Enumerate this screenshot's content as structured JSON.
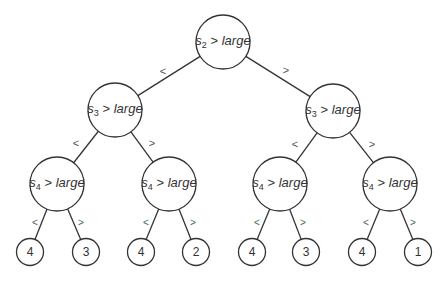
{
  "diagram": {
    "type": "binary decision tree",
    "colors": {
      "line": "#333333",
      "edge_label": "#555555",
      "background": "#ffffff"
    },
    "nodes": [
      {
        "id": "root",
        "var": "s",
        "sub": "2",
        "op": ">",
        "value": "large",
        "cx": 223,
        "cy": 42,
        "r": 27
      },
      {
        "id": "L",
        "var": "s",
        "sub": "3",
        "op": ">",
        "value": "large",
        "cx": 115,
        "cy": 110,
        "r": 27
      },
      {
        "id": "R",
        "var": "s",
        "sub": "3",
        "op": ">",
        "value": "large",
        "cx": 333,
        "cy": 111,
        "r": 27
      },
      {
        "id": "LL",
        "var": "s",
        "sub": "4",
        "op": ">",
        "value": "large",
        "cx": 57,
        "cy": 184,
        "r": 27
      },
      {
        "id": "LR",
        "var": "s",
        "sub": "4",
        "op": ">",
        "value": "large",
        "cx": 169,
        "cy": 184,
        "r": 27
      },
      {
        "id": "RL",
        "var": "s",
        "sub": "4",
        "op": ">",
        "value": "large",
        "cx": 280,
        "cy": 184,
        "r": 27
      },
      {
        "id": "RR",
        "var": "s",
        "sub": "4",
        "op": ">",
        "value": "large",
        "cx": 390,
        "cy": 184,
        "r": 27
      }
    ],
    "leaves": [
      {
        "label": "4",
        "cx": 30,
        "cy": 252,
        "r": 13.5
      },
      {
        "label": "3",
        "cx": 86,
        "cy": 252,
        "r": 13.5
      },
      {
        "label": "4",
        "cx": 141,
        "cy": 252,
        "r": 13.5
      },
      {
        "label": "2",
        "cx": 196,
        "cy": 252,
        "r": 13.5
      },
      {
        "label": "4",
        "cx": 252,
        "cy": 252,
        "r": 13.5
      },
      {
        "label": "3",
        "cx": 306,
        "cy": 252,
        "r": 13.5
      },
      {
        "label": "4",
        "cx": 362,
        "cy": 252,
        "r": 13.5
      },
      {
        "label": "1",
        "cx": 418,
        "cy": 252,
        "r": 13.5
      }
    ],
    "edge_labels": [
      {
        "text": "<",
        "x": 163,
        "y": 71,
        "level": 1
      },
      {
        "text": ">",
        "x": 286,
        "y": 70,
        "level": 1
      },
      {
        "text": "<",
        "x": 76,
        "y": 143,
        "level": 2
      },
      {
        "text": ">",
        "x": 152,
        "y": 143,
        "level": 2
      },
      {
        "text": "<",
        "x": 295,
        "y": 144,
        "level": 2
      },
      {
        "text": ">",
        "x": 372,
        "y": 144,
        "level": 2
      },
      {
        "text": "<",
        "x": 35,
        "y": 223,
        "level": 3
      },
      {
        "text": ">",
        "x": 81,
        "y": 223,
        "level": 3
      },
      {
        "text": "<",
        "x": 146,
        "y": 223,
        "level": 3
      },
      {
        "text": ">",
        "x": 193,
        "y": 223,
        "level": 3
      },
      {
        "text": "<",
        "x": 257,
        "y": 223,
        "level": 3
      },
      {
        "text": ">",
        "x": 303,
        "y": 223,
        "level": 3
      },
      {
        "text": "<",
        "x": 366,
        "y": 223,
        "level": 3
      },
      {
        "text": ">",
        "x": 413,
        "y": 223,
        "level": 3
      }
    ],
    "edges": [
      [
        "root",
        "L"
      ],
      [
        "root",
        "R"
      ],
      [
        "L",
        "LL"
      ],
      [
        "L",
        "LR"
      ],
      [
        "R",
        "RL"
      ],
      [
        "R",
        "RR"
      ],
      [
        "LL",
        0
      ],
      [
        "LL",
        1
      ],
      [
        "LR",
        2
      ],
      [
        "LR",
        3
      ],
      [
        "RL",
        4
      ],
      [
        "RL",
        5
      ],
      [
        "RR",
        6
      ],
      [
        "RR",
        7
      ]
    ]
  }
}
